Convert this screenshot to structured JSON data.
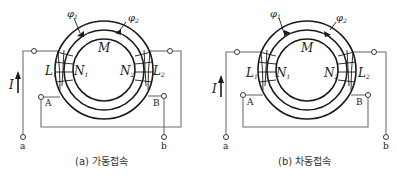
{
  "diagrams": [
    {
      "id": "a",
      "caption": "(a) 가동접속",
      "labels": {
        "phi1": "φ",
        "phi1_sub": "1",
        "phi2": "φ",
        "phi2_sub": "2",
        "M": "M",
        "L1": "L",
        "L1_sub": "1",
        "N1": "N",
        "N1_sub": "1",
        "N2": "N",
        "N2_sub": "2",
        "L2": "L",
        "L2_sub": "2",
        "I": "I",
        "A": "A",
        "B": "B",
        "a": "a",
        "b": "b"
      }
    },
    {
      "id": "b",
      "caption": "(b) 차동접속",
      "labels": {
        "phi1": "φ",
        "phi1_sub": "1",
        "phi2": "φ",
        "phi2_sub": "2",
        "M": "M",
        "L1": "L",
        "L1_sub": "1",
        "N1": "N",
        "N1_sub": "1",
        "N2": "N",
        "N2_sub": "2",
        "L2": "L",
        "L2_sub": "2",
        "I": "I",
        "A": "A",
        "B": "B",
        "a": "a",
        "b": "b"
      }
    }
  ],
  "colors": {
    "ring": "#1a1a1a",
    "wire": "#6e6e6e",
    "text": "#1a1a1a"
  }
}
